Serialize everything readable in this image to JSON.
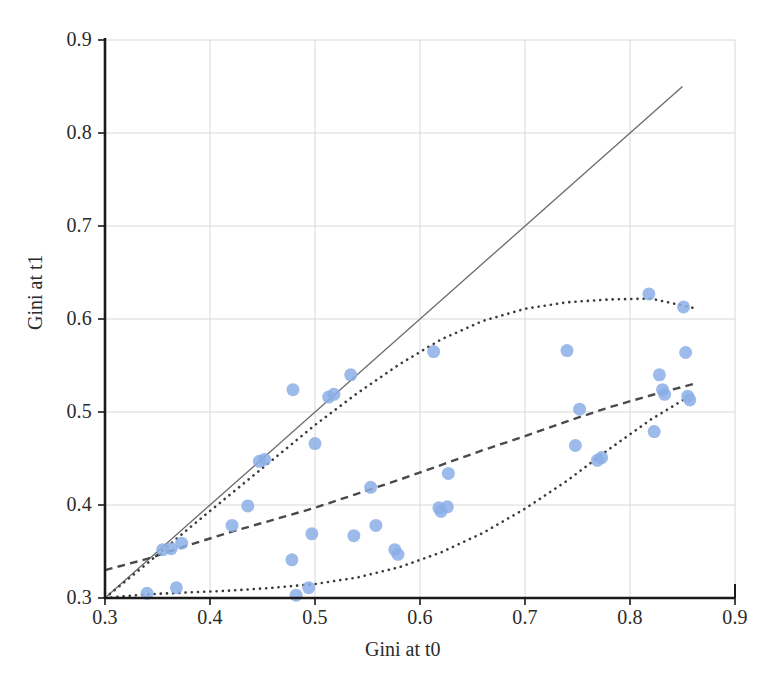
{
  "chart_data": {
    "type": "scatter",
    "title": "",
    "xlabel": "Gini at t0",
    "ylabel": "Gini at t1",
    "xlim": [
      0.3,
      0.9
    ],
    "ylim": [
      0.3,
      0.9
    ],
    "xticks": [
      "0.3",
      "0.4",
      "0.5",
      "0.6",
      "0.7",
      "0.8",
      "0.9"
    ],
    "yticks": [
      "0.3",
      "0.4",
      "0.5",
      "0.6",
      "0.7",
      "0.8",
      "0.9"
    ],
    "xtick_values": [
      0.3,
      0.4,
      0.5,
      0.6,
      0.7,
      0.8,
      0.9
    ],
    "ytick_values": [
      0.3,
      0.4,
      0.5,
      0.6,
      0.7,
      0.8,
      0.9
    ],
    "grid": true,
    "legend": "none",
    "marker_color": "#8BAEE6",
    "marker_size": 13,
    "points": [
      {
        "x": 0.34,
        "y": 0.305
      },
      {
        "x": 0.355,
        "y": 0.352
      },
      {
        "x": 0.363,
        "y": 0.353
      },
      {
        "x": 0.368,
        "y": 0.311
      },
      {
        "x": 0.373,
        "y": 0.359
      },
      {
        "x": 0.421,
        "y": 0.378
      },
      {
        "x": 0.436,
        "y": 0.399
      },
      {
        "x": 0.447,
        "y": 0.447
      },
      {
        "x": 0.452,
        "y": 0.449
      },
      {
        "x": 0.478,
        "y": 0.341
      },
      {
        "x": 0.479,
        "y": 0.524
      },
      {
        "x": 0.482,
        "y": 0.303
      },
      {
        "x": 0.494,
        "y": 0.311
      },
      {
        "x": 0.497,
        "y": 0.369
      },
      {
        "x": 0.5,
        "y": 0.466
      },
      {
        "x": 0.513,
        "y": 0.516
      },
      {
        "x": 0.518,
        "y": 0.519
      },
      {
        "x": 0.534,
        "y": 0.54
      },
      {
        "x": 0.537,
        "y": 0.367
      },
      {
        "x": 0.553,
        "y": 0.419
      },
      {
        "x": 0.558,
        "y": 0.378
      },
      {
        "x": 0.576,
        "y": 0.352
      },
      {
        "x": 0.579,
        "y": 0.347
      },
      {
        "x": 0.613,
        "y": 0.565
      },
      {
        "x": 0.618,
        "y": 0.397
      },
      {
        "x": 0.62,
        "y": 0.393
      },
      {
        "x": 0.626,
        "y": 0.398
      },
      {
        "x": 0.627,
        "y": 0.434
      },
      {
        "x": 0.74,
        "y": 0.566
      },
      {
        "x": 0.748,
        "y": 0.464
      },
      {
        "x": 0.752,
        "y": 0.503
      },
      {
        "x": 0.769,
        "y": 0.448
      },
      {
        "x": 0.773,
        "y": 0.451
      },
      {
        "x": 0.818,
        "y": 0.627
      },
      {
        "x": 0.823,
        "y": 0.479
      },
      {
        "x": 0.828,
        "y": 0.54
      },
      {
        "x": 0.831,
        "y": 0.524
      },
      {
        "x": 0.833,
        "y": 0.519
      },
      {
        "x": 0.851,
        "y": 0.613
      },
      {
        "x": 0.853,
        "y": 0.564
      },
      {
        "x": 0.855,
        "y": 0.517
      },
      {
        "x": 0.857,
        "y": 0.513
      }
    ],
    "lines": [
      {
        "name": "identity-line",
        "style": "solid",
        "color": "#6a6a6a",
        "width": 1.3,
        "points": [
          [
            0.3,
            0.3
          ],
          [
            0.85,
            0.85
          ]
        ]
      },
      {
        "name": "median-curve",
        "style": "dashed",
        "color": "#4a4a4a",
        "width": 2.4,
        "points": [
          [
            0.3,
            0.33
          ],
          [
            0.34,
            0.342
          ],
          [
            0.38,
            0.357
          ],
          [
            0.42,
            0.371
          ],
          [
            0.46,
            0.384
          ],
          [
            0.5,
            0.397
          ],
          [
            0.54,
            0.412
          ],
          [
            0.58,
            0.427
          ],
          [
            0.62,
            0.443
          ],
          [
            0.66,
            0.459
          ],
          [
            0.7,
            0.474
          ],
          [
            0.74,
            0.49
          ],
          [
            0.78,
            0.505
          ],
          [
            0.82,
            0.518
          ],
          [
            0.86,
            0.53
          ]
        ]
      },
      {
        "name": "upper-band-curve",
        "style": "dotted",
        "color": "#3b3b3b",
        "width": 2.6,
        "points": [
          [
            0.3,
            0.3
          ],
          [
            0.34,
            0.337
          ],
          [
            0.38,
            0.375
          ],
          [
            0.42,
            0.412
          ],
          [
            0.46,
            0.449
          ],
          [
            0.5,
            0.486
          ],
          [
            0.54,
            0.52
          ],
          [
            0.58,
            0.551
          ],
          [
            0.62,
            0.578
          ],
          [
            0.66,
            0.598
          ],
          [
            0.7,
            0.611
          ],
          [
            0.74,
            0.618
          ],
          [
            0.78,
            0.621
          ],
          [
            0.82,
            0.622
          ],
          [
            0.86,
            0.612
          ]
        ]
      },
      {
        "name": "lower-band-curve",
        "style": "dotted",
        "color": "#3b3b3b",
        "width": 2.6,
        "points": [
          [
            0.3,
            0.3
          ],
          [
            0.34,
            0.304
          ],
          [
            0.38,
            0.306
          ],
          [
            0.42,
            0.308
          ],
          [
            0.46,
            0.311
          ],
          [
            0.5,
            0.315
          ],
          [
            0.54,
            0.322
          ],
          [
            0.58,
            0.333
          ],
          [
            0.62,
            0.349
          ],
          [
            0.66,
            0.37
          ],
          [
            0.7,
            0.396
          ],
          [
            0.74,
            0.426
          ],
          [
            0.78,
            0.46
          ],
          [
            0.82,
            0.492
          ],
          [
            0.855,
            0.516
          ]
        ]
      }
    ]
  },
  "axes": {
    "left_spine_color": "#1a1a1a",
    "bottom_spine_color": "#1a1a1a",
    "grid_color": "#d8d8d8",
    "background": "#ffffff"
  }
}
